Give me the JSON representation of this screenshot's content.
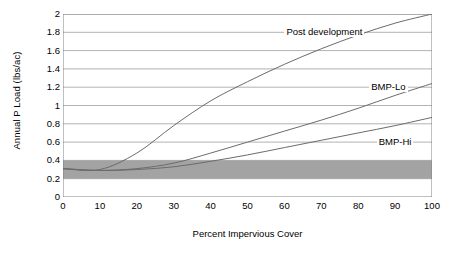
{
  "chart_data": {
    "type": "line",
    "title": "",
    "xlabel": "Percent Impervious Cover",
    "ylabel": "Annual P Load (lbs/ac)",
    "xlim": [
      0,
      100
    ],
    "ylim": [
      0,
      2
    ],
    "xticks": [
      0,
      10,
      20,
      30,
      40,
      50,
      60,
      70,
      80,
      90,
      100
    ],
    "yticks": [
      0,
      0.2,
      0.4,
      0.6,
      0.8,
      1,
      1.2,
      1.4,
      1.6,
      1.8,
      2
    ],
    "xtick_labels": [
      "0",
      "10",
      "20",
      "30",
      "40",
      "50",
      "60",
      "70",
      "80",
      "90",
      "100"
    ],
    "ytick_labels": [
      "0",
      "0.2",
      "0.4",
      "0.6",
      "0.8",
      "1",
      "1.2",
      "1.4",
      "1.6",
      "1.8",
      "2"
    ],
    "grid": "horizontal",
    "legend": "inline-annotations",
    "band": {
      "name": "Pre-development range",
      "y_min": 0.2,
      "y_max": 0.4,
      "color": "#a3a3a3"
    },
    "x": [
      0,
      10,
      20,
      30,
      40,
      50,
      60,
      70,
      80,
      90,
      100
    ],
    "series": [
      {
        "name": "Post development",
        "color": "#6b6b6b",
        "values": [
          0.31,
          0.3,
          0.48,
          0.78,
          1.05,
          1.26,
          1.45,
          1.62,
          1.77,
          1.9,
          2.0
        ],
        "label_x": 60,
        "label_y": 1.8
      },
      {
        "name": "BMP-Lo",
        "color": "#6b6b6b",
        "values": [
          0.31,
          0.29,
          0.31,
          0.37,
          0.48,
          0.6,
          0.72,
          0.84,
          0.97,
          1.11,
          1.24
        ],
        "label_x": 83,
        "label_y": 1.2
      },
      {
        "name": "BMP-Hi",
        "color": "#6b6b6b",
        "values": [
          0.31,
          0.29,
          0.3,
          0.33,
          0.39,
          0.46,
          0.54,
          0.62,
          0.7,
          0.78,
          0.87
        ],
        "label_x": 85,
        "label_y": 0.6
      }
    ]
  },
  "axis": {
    "frame_color": "#808080",
    "grid_color": "#9e9e9e"
  }
}
